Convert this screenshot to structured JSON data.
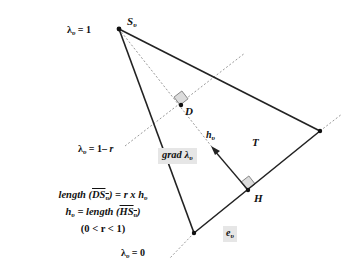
{
  "diagram": {
    "vertices": {
      "S": {
        "label": "S",
        "sub": "υ",
        "x": 119,
        "y": 29
      },
      "R": {
        "x": 320,
        "y": 131
      },
      "B": {
        "x": 194,
        "y": 233
      },
      "D": {
        "label": "D",
        "x": 181,
        "y": 105
      },
      "H": {
        "label": "H",
        "x": 248,
        "y": 190
      }
    },
    "labels": {
      "lambda_1": {
        "pre": "λ",
        "sub": "υ",
        "post": " = 1"
      },
      "lambda_1r": {
        "pre": "λ",
        "sub": "υ",
        "post": " = 1– ",
        "var": "r"
      },
      "lambda_0": {
        "pre": "λ",
        "sub": "υ",
        "post": " = 0"
      },
      "grad": {
        "pre": "grad λ",
        "sub": "υ"
      },
      "h": {
        "pre": "h",
        "sub": "υ"
      },
      "T": "T",
      "e": {
        "pre": "e",
        "sub": "υ"
      }
    },
    "formula": {
      "line1": {
        "a": "length (",
        "b": "DS",
        "sub": "υ",
        "c": ") = r x h",
        "sub2": "υ"
      },
      "line2": {
        "a": "h",
        "sub": "υ",
        "b": " = length (",
        "c": "HS",
        "sub2": "υ",
        "d": ")"
      },
      "line3": "(0 < r < 1)"
    },
    "colors": {
      "line": "#222222",
      "dashed": "#999999",
      "label_box": "#e6e6e6",
      "right_angle_fill": "#dddddd"
    }
  }
}
